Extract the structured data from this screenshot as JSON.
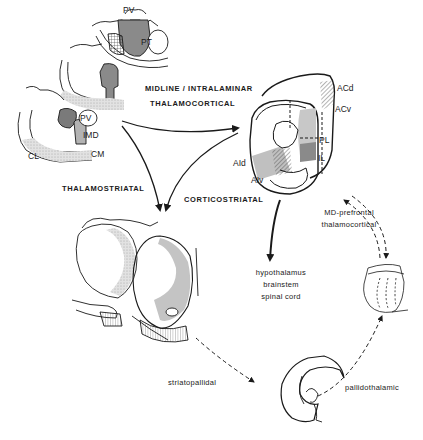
{
  "figure": {
    "colors": {
      "line": "#1a1a1a",
      "shade_dark": "#8a8a8a",
      "shade_mid": "#b3b3b3",
      "shade_light": "#d9d9d9",
      "background": "#ffffff"
    }
  },
  "nodes": {
    "thalamus": {
      "name": "thalamus sections",
      "regions": [
        "PV",
        "PT",
        "PV",
        "IMD",
        "CL",
        "CM"
      ]
    },
    "cortex": {
      "name": "prefrontal cortex section",
      "regions": [
        "ACd",
        "ACv",
        "PL",
        "IL",
        "AId",
        "AIv"
      ]
    },
    "striatum": {
      "name": "striatum sections"
    },
    "pallidum": {
      "name": "ventral pallidum section"
    },
    "md_thalamus": {
      "name": "mediodorsal thalamus section"
    }
  },
  "labels": {
    "pv_top": "PV",
    "pt": "PT",
    "pv_bottom": "PV",
    "imd": "IMD",
    "cl": "CL",
    "cm": "CM",
    "acd": "ACd",
    "acv": "ACv",
    "pl": "PL",
    "il": "IL",
    "aid": "AId",
    "aiv": "AIv"
  },
  "pathways": {
    "midline_line1": "MIDLINE / INTRALAMINAR",
    "midline_line2": "THALAMOCORTICAL",
    "thalamostriatal": "THALAMOSTRIATAL",
    "corticostriatal": "CORTICOSTRIATAL",
    "md_line1": "MD-prefrontal",
    "md_line2": "thalamocortical",
    "striatopallidal": "striatopallidal",
    "pallidothalamic": "pallidothalamic",
    "targets_line1": "hypothalamus",
    "targets_line2": "brainstem",
    "targets_line3": "spinal cord"
  },
  "edges": [
    {
      "from": "thalamus",
      "to": "cortex",
      "label": "MIDLINE / INTRALAMINAR THALAMOCORTICAL",
      "style": "solid"
    },
    {
      "from": "thalamus",
      "to": "striatum",
      "label": "THALAMOSTRIATAL",
      "style": "solid"
    },
    {
      "from": "cortex",
      "to": "striatum",
      "label": "CORTICOSTRIATAL",
      "style": "solid"
    },
    {
      "from": "cortex",
      "to": "hypothalamus / brainstem / spinal cord",
      "label": "",
      "style": "solid-bold"
    },
    {
      "from": "striatum",
      "to": "pallidum",
      "label": "striatopallidal",
      "style": "dashed"
    },
    {
      "from": "pallidum",
      "to": "md_thalamus",
      "label": "pallidothalamic",
      "style": "dashed"
    },
    {
      "from": "md_thalamus",
      "to": "cortex",
      "label": "MD-prefrontal thalamocortical",
      "style": "dashed-double",
      "bidirectional": true
    }
  ]
}
